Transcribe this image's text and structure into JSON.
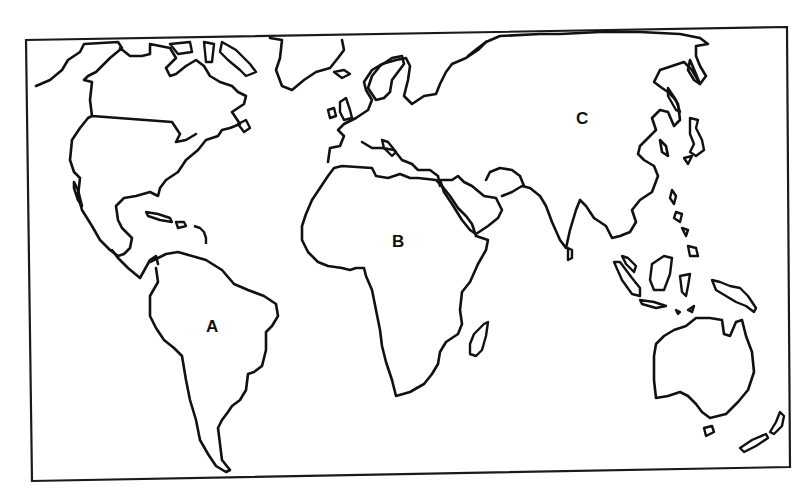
{
  "map": {
    "type": "outline-world-map",
    "projection_hint": "Miller-like, Pacific cropped (Americas left, Australia right)",
    "colors": {
      "outline": "#111111",
      "background": "#ffffff",
      "frame": "#1a1a1a"
    },
    "labels": [
      {
        "id": "A",
        "text": "A",
        "region": "South America",
        "x": 206,
        "y": 318
      },
      {
        "id": "B",
        "text": "B",
        "region": "Africa",
        "x": 392,
        "y": 233
      },
      {
        "id": "C",
        "text": "C",
        "region": "Asia",
        "x": 576,
        "y": 110
      }
    ]
  }
}
